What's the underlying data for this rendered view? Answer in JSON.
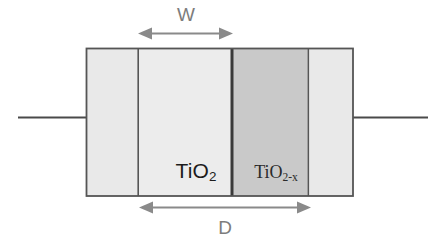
{
  "figure": {
    "background_color": "#ffffff"
  },
  "device": {
    "outline_color": "#555555",
    "terminals": {
      "left_wire_label": "left-terminal-wire",
      "right_wire_label": "right-terminal-wire",
      "wire_color": "#4a4a4a"
    },
    "layers": [
      {
        "name": "left-electrode",
        "label": "",
        "fill_color": "#e9e9e9"
      },
      {
        "name": "tio2-layer",
        "label": "TiO",
        "subscript": "2",
        "fill_color": "#ececec"
      },
      {
        "name": "tio2x-layer",
        "label": "TiO",
        "subscript": "2-x",
        "fill_color": "#c9c9c9"
      },
      {
        "name": "right-electrode",
        "label": "",
        "fill_color": "#e9e9e9"
      }
    ]
  },
  "dimensions": {
    "width_marker": {
      "label": "W",
      "color": "#8a8a8a",
      "meaning": "doped region width"
    },
    "total_marker": {
      "label": "D",
      "color": "#8a8a8a",
      "meaning": "total device thickness"
    }
  }
}
